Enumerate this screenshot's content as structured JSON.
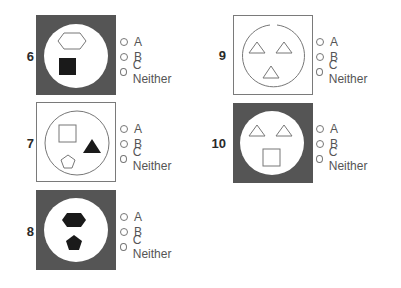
{
  "questions": [
    {
      "number": "6",
      "background": "dark",
      "shapes": [
        "outline hexagon",
        "filled square"
      ],
      "options": [
        "A",
        "B",
        "C Neither"
      ]
    },
    {
      "number": "7",
      "background": "light",
      "shapes": [
        "outline square",
        "filled triangle",
        "outline pentagon"
      ],
      "options": [
        "A",
        "B",
        "C Neither"
      ]
    },
    {
      "number": "8",
      "background": "dark",
      "shapes": [
        "filled hexagon",
        "filled pentagon"
      ],
      "options": [
        "A",
        "B",
        "C Neither"
      ]
    },
    {
      "number": "9",
      "background": "light",
      "circle": "broken at top",
      "shapes": [
        "outline triangle",
        "outline triangle",
        "outline triangle"
      ],
      "options": [
        "A",
        "B",
        "C Neither"
      ]
    },
    {
      "number": "10",
      "background": "dark",
      "shapes": [
        "outline triangle",
        "outline triangle",
        "outline square"
      ],
      "options": [
        "A",
        "B",
        "C Neither"
      ]
    }
  ],
  "colors": {
    "dark_box": "#555555",
    "shape_stroke": "#777777",
    "shape_fill": "#1a1a1a",
    "text": "#555555"
  }
}
